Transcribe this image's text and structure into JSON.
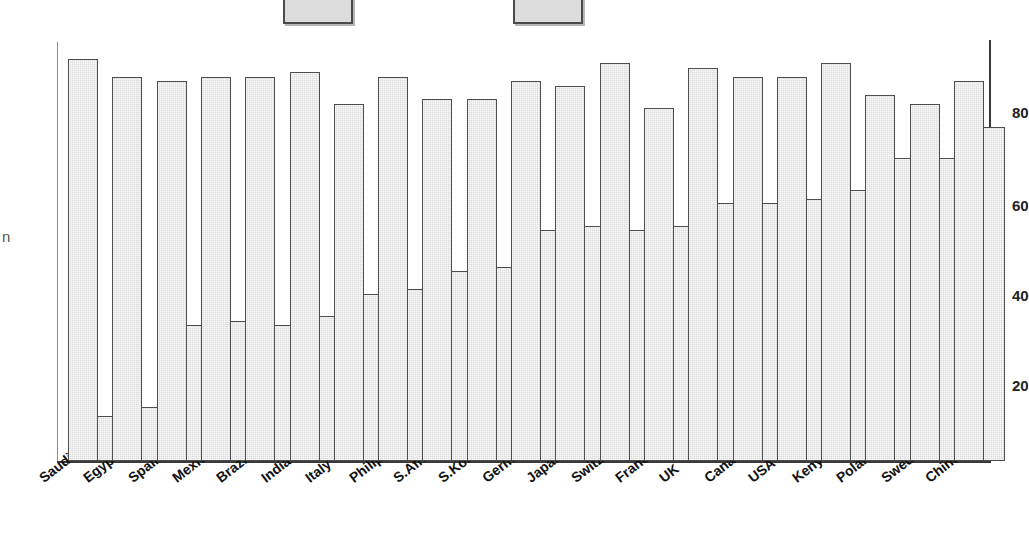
{
  "legend": {
    "items": [
      {
        "label": "Men",
        "swatch_color": "#dcdcdc",
        "x": 283,
        "label_x": 360
      },
      {
        "label": "Women",
        "swatch_color": "#dcdcdc",
        "x": 513,
        "label_x": 590
      }
    ]
  },
  "axis": {
    "y_label_fragment": "n",
    "ticks": [
      {
        "label": "80",
        "y": 112
      },
      {
        "label": "60",
        "y": 205
      },
      {
        "label": "40",
        "y": 295
      },
      {
        "label": "20",
        "y": 385
      }
    ]
  },
  "chart_data": {
    "type": "bar",
    "title": "",
    "subtitle": "",
    "xlabel": "",
    "ylabel": "",
    "ylim": [
      0,
      90
    ],
    "grid": false,
    "legend_position": "top",
    "categories": [
      "Saudi Arabia",
      "Egypt",
      "Spain",
      "Mexico",
      "Brazil",
      "India",
      "Italy",
      "Philippines",
      "S.Africa",
      "S.Korea",
      "Germany",
      "Japan",
      "Switzerland",
      "France",
      "UK",
      "Canada",
      "USA",
      "Kenya",
      "Poland",
      "Sweden",
      "China"
    ],
    "series": [
      {
        "name": "Men",
        "values": [
          89,
          85,
          84,
          85,
          85,
          86,
          79,
          85,
          80,
          80,
          84,
          83,
          88,
          78,
          87,
          85,
          85,
          88,
          81,
          79,
          84
        ]
      },
      {
        "name": "Women",
        "values": [
          10,
          12,
          30,
          31,
          30,
          32,
          37,
          38,
          42,
          43,
          51,
          52,
          51,
          52,
          57,
          57,
          58,
          60,
          67,
          67,
          74
        ]
      }
    ]
  },
  "layout": {
    "plot_left": 57,
    "plot_right": 990,
    "baseline_y": 461,
    "bar_width": 30,
    "group_pitch": 44.3,
    "px_per_unit": 4.52
  }
}
